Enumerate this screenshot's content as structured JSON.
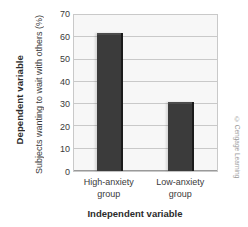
{
  "chart_data": {
    "type": "bar",
    "title": "",
    "categories": [
      "High-anxiety group",
      "Low-anxiety group"
    ],
    "category_lines": [
      [
        "High-anxiety",
        "group"
      ],
      [
        "Low-anxiety",
        "group"
      ]
    ],
    "values": [
      62,
      31
    ],
    "xlabel": "Independent variable",
    "ylabel": "Subjects wanting to wait with others (%)",
    "ylabel_outer": "Dependent variable",
    "ylim": [
      0,
      70
    ],
    "yticks": [
      70,
      60,
      50,
      40,
      30,
      20,
      10,
      0
    ],
    "grid": true,
    "legend": "none",
    "bar_color": "#3b3b3b",
    "plot_background": "#f7f7f7",
    "grid_color": "#c9c9c9"
  },
  "credit": {
    "text": "© Cengage Learning"
  }
}
